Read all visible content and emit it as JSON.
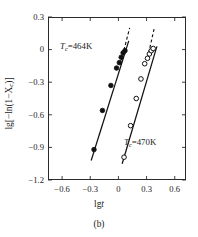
{
  "figure": {
    "caption": "(b)",
    "xlabel_prefix": "lg",
    "xlabel_var": "t",
    "ylabel": "lg[−ln(1−X",
    "ylabel_sub": "c",
    "ylabel_tail": ")]"
  },
  "chart_data": {
    "type": "scatter",
    "title": "",
    "subtitle": "(b)",
    "xlabel": "lgt",
    "ylabel": "lg[−ln(1−Xc)]",
    "xlim": [
      -0.75,
      0.72
    ],
    "ylim": [
      -1.2,
      0.3
    ],
    "xticks": [
      "−0.6",
      "−0.3",
      "0",
      "0.3",
      "0.6"
    ],
    "xtick_values": [
      -0.6,
      -0.3,
      0,
      0.3,
      0.6
    ],
    "yticks": [
      "0.3",
      "0",
      "−0.3",
      "−0.6",
      "−0.9",
      "−1.2"
    ],
    "ytick_values": [
      0.3,
      0,
      -0.3,
      -0.6,
      -0.9,
      -1.2
    ],
    "grid": false,
    "legend": "none",
    "annotations": [
      {
        "name": "Tc-464K-label",
        "prefix": "T",
        "sub": "c",
        "text": "=464K",
        "x": -0.22,
        "y": 0.13
      },
      {
        "name": "Tc-470K-label",
        "prefix": "T",
        "sub": "c",
        "text": "=470K",
        "x": 0.22,
        "y": -0.78
      }
    ],
    "series": [
      {
        "name": "Tc=464K",
        "marker": "filled-circle",
        "color": "#111111",
        "x": [
          -0.26,
          -0.17,
          -0.08,
          -0.02,
          0.01,
          0.03,
          0.05,
          0.07
        ],
        "y": [
          -0.92,
          -0.56,
          -0.33,
          -0.17,
          -0.12,
          -0.07,
          -0.03,
          -0.01
        ],
        "fit_line": {
          "x": [
            -0.29,
            0.11
          ],
          "y": [
            -1.02,
            0.08
          ]
        },
        "dashed_line": {
          "x": [
            0.03,
            0.12
          ],
          "y": [
            -0.1,
            0.2
          ]
        }
      },
      {
        "name": "Tc=470K",
        "marker": "open-circle",
        "color": "#111111",
        "x": [
          0.06,
          0.13,
          0.19,
          0.24,
          0.28,
          0.31,
          0.33,
          0.35,
          0.37
        ],
        "y": [
          -0.99,
          -0.7,
          -0.45,
          -0.27,
          -0.13,
          -0.08,
          -0.04,
          -0.01,
          0.01
        ],
        "fit_line": {
          "x": [
            0.04,
            0.41
          ],
          "y": [
            -1.05,
            0.03
          ]
        },
        "dashed_line": {
          "x": [
            0.31,
            0.38
          ],
          "y": [
            -0.08,
            0.19
          ]
        }
      }
    ]
  }
}
